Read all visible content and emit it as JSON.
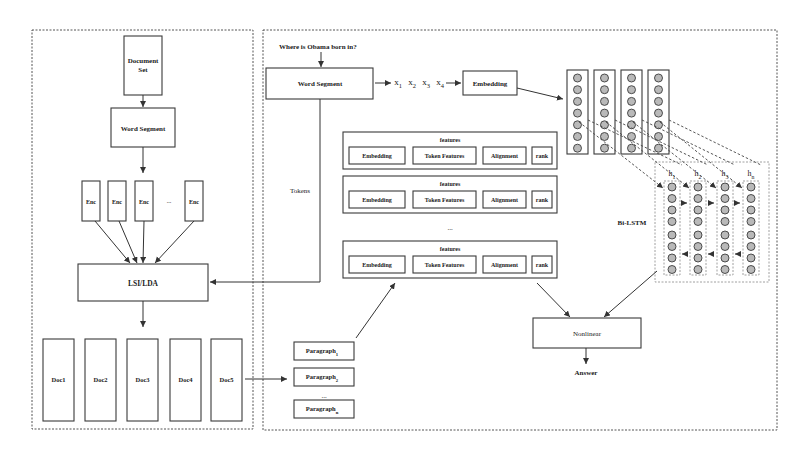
{
  "left_panel": {
    "document_set": "Document Set",
    "word_segment": "Word Segment",
    "encoders": [
      "Enc",
      "Enc",
      "Enc",
      "Enc"
    ],
    "encoder_ellipsis": "...",
    "lsi_lda": "LSI/LDA",
    "docs": [
      "Doc1",
      "Doc2",
      "Doc3",
      "Doc4",
      "Doc5"
    ]
  },
  "right_panel": {
    "question": "Where is Obama born in?",
    "word_segment": "Word Segment",
    "tokens_label": "Tokens",
    "token_sequence": [
      {
        "base": "x",
        "sub": "1"
      },
      {
        "base": "x",
        "sub": "2"
      },
      {
        "base": "x",
        "sub": "3"
      },
      {
        "base": "x",
        "sub": "4"
      }
    ],
    "embedding": "Embedding",
    "feature_groups": [
      {
        "title": "features",
        "items": [
          "Embedding",
          "Token Features",
          "Alignment",
          "rank"
        ]
      },
      {
        "title": "features",
        "items": [
          "Embedding",
          "Token Features",
          "Alignment",
          "rank"
        ]
      },
      {
        "title": "features",
        "items": [
          "Embedding",
          "Token Features",
          "Alignment",
          "rank"
        ]
      }
    ],
    "feature_ellipsis": "...",
    "bilstm_label": "Bi-LSTM",
    "hidden_states": [
      {
        "base": "h",
        "sub": "1"
      },
      {
        "base": "h",
        "sub": "2"
      },
      {
        "base": "h",
        "sub": "3"
      },
      {
        "base": "h",
        "sub": "n"
      }
    ],
    "paragraphs": [
      {
        "base": "Paragraph",
        "sub": "1"
      },
      {
        "base": "Paragraph",
        "sub": "2"
      },
      {
        "base": "Paragraph",
        "sub": "n"
      }
    ],
    "paragraph_ellipsis": "...",
    "nonlinear": "Nonlinear",
    "answer": "Answer"
  }
}
